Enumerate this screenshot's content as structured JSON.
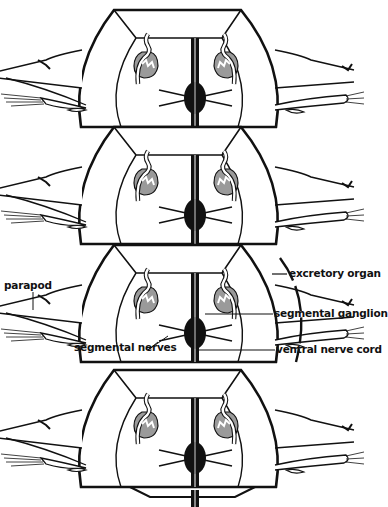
{
  "diagram": {
    "segment_count": 4,
    "colors": {
      "ink": "#111111",
      "organ_fill": "#9a9a9a",
      "background": "#ffffff"
    }
  },
  "labels": {
    "parapod": "parapod",
    "excretory_organ": "excretory organ",
    "segmental_ganglion": "segmental ganglion",
    "segmental_nerves": "segmental nerves",
    "ventral_nerve_cord": "ventral nerve cord"
  }
}
